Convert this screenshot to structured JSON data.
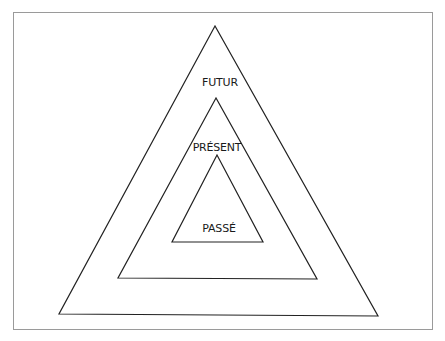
{
  "diagram": {
    "type": "nested-triangles",
    "triangles": [
      {
        "name": "outer",
        "points": [
          [
            215,
            26
          ],
          [
            59,
            314
          ],
          [
            378,
            316
          ]
        ],
        "label": "FUTUR",
        "label_pos": [
          220,
          82
        ]
      },
      {
        "name": "middle",
        "points": [
          [
            216,
            98
          ],
          [
            118,
            278
          ],
          [
            317,
            279
          ]
        ],
        "label": "PRÉSENT",
        "label_pos": [
          217,
          147
        ]
      },
      {
        "name": "inner",
        "points": [
          [
            217,
            155
          ],
          [
            172,
            242
          ],
          [
            263,
            242
          ]
        ],
        "label": "PASSÉ",
        "label_pos": [
          219,
          228
        ]
      }
    ],
    "stroke": "#222222"
  },
  "labels": {
    "futur": "FUTUR",
    "present": "PRÉSENT",
    "passe": "PASSÉ"
  }
}
